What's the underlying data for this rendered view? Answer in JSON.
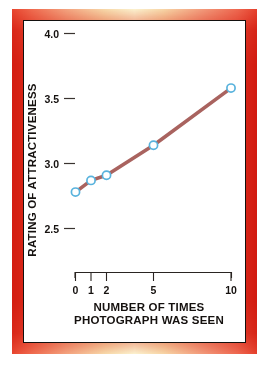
{
  "figure": {
    "name": "attractiveness-exposure-line-chart",
    "frame_color_outer": "#e5402c",
    "frame_color_highlight": "#fbf2cf",
    "card_background": "#ffffff",
    "card_border_color": "#13100e"
  },
  "chart_data": {
    "type": "line",
    "title": "",
    "subtitle": "",
    "xlabel": "NUMBER OF TIMES PHOTOGRAPH WAS SEEN",
    "xlabel_lines": [
      "NUMBER OF TIMES",
      "PHOTOGRAPH WAS SEEN"
    ],
    "ylabel": "RATING OF ATTRACTIVENESS",
    "x": [
      0,
      1,
      2,
      5,
      10
    ],
    "xtick_labels": [
      "0",
      "1",
      "2",
      "5",
      "10"
    ],
    "values": [
      2.78,
      2.87,
      2.91,
      3.14,
      3.58
    ],
    "ytick_labels": [
      "4.0",
      "3.5",
      "3.0",
      "2.5"
    ],
    "ytick_values": [
      4.0,
      3.5,
      3.0,
      2.5
    ],
    "ylim": [
      2.5,
      4.0
    ],
    "xlim": [
      0,
      10
    ],
    "grid": false,
    "legend": false,
    "legend_position": "none",
    "series": [
      {
        "name": "mean attractiveness rating",
        "line_color": "#a9635f",
        "marker_edge_color": "#59b3dd",
        "marker_face_color": "#ffffff",
        "values": [
          2.78,
          2.87,
          2.91,
          3.14,
          3.58
        ]
      }
    ],
    "annotations": []
  },
  "axes": {
    "y_tick_0": "4.0",
    "y_tick_1": "3.5",
    "y_tick_2": "3.0",
    "y_tick_3": "2.5",
    "x_tick_0": "0",
    "x_tick_1": "1",
    "x_tick_2": "2",
    "x_tick_3": "5",
    "x_tick_4": "10",
    "y_axis_title": "RATING OF ATTRACTIVENESS",
    "x_axis_title_line1": "NUMBER OF TIMES",
    "x_axis_title_line2": "PHOTOGRAPH WAS SEEN"
  }
}
